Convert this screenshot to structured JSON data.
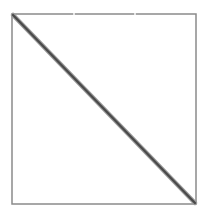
{
  "diagram": {
    "box": {
      "x": 12,
      "y": 14,
      "width": 184,
      "height": 190,
      "stroke": "#8a8a8a",
      "stroke_width": 1.5
    },
    "top_border_gaps": [
      74,
      135
    ],
    "diagonal": {
      "x1": 13,
      "y1": 15,
      "x2": 195,
      "y2": 203,
      "stroke": "#555555",
      "stroke_width": 3
    },
    "background": "#ffffff"
  }
}
